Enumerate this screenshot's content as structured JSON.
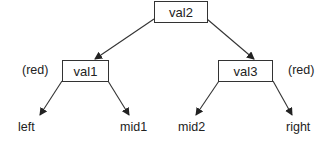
{
  "diagram": {
    "type": "tree",
    "colors": {
      "line": "#333333",
      "text": "#222222",
      "background": "#ffffff"
    },
    "nodes": [
      {
        "id": "val2",
        "label": "val2",
        "annotation": ""
      },
      {
        "id": "val1",
        "label": "val1",
        "annotation": "(red)"
      },
      {
        "id": "val3",
        "label": "val3",
        "annotation": "(red)"
      }
    ],
    "leaves": [
      {
        "id": "left",
        "label": "left"
      },
      {
        "id": "mid1",
        "label": "mid1"
      },
      {
        "id": "mid2",
        "label": "mid2"
      },
      {
        "id": "right",
        "label": "right"
      }
    ],
    "edges": [
      {
        "from": "val2",
        "to": "val1"
      },
      {
        "from": "val2",
        "to": "val3"
      },
      {
        "from": "val1",
        "to": "left"
      },
      {
        "from": "val1",
        "to": "mid1"
      },
      {
        "from": "val3",
        "to": "mid2"
      },
      {
        "from": "val3",
        "to": "right"
      }
    ]
  }
}
